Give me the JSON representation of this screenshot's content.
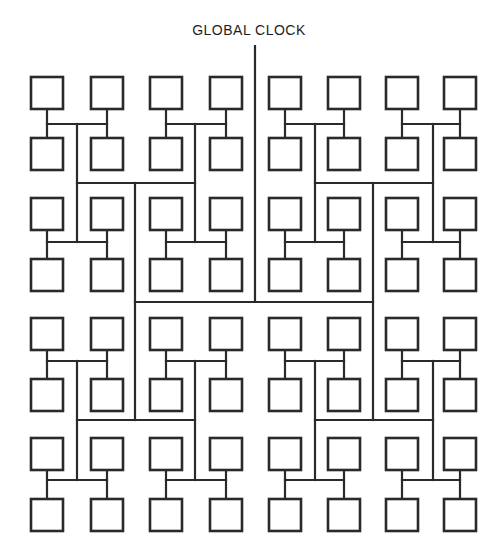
{
  "diagram": {
    "title": "GLOBAL CLOCK",
    "type": "H-tree clock distribution network",
    "grid": {
      "columns": 8,
      "rows": 8,
      "leaf_count": 64
    },
    "box_size": 32,
    "colors": {
      "line": "#2a2a2a",
      "background": "#ffffff"
    }
  }
}
